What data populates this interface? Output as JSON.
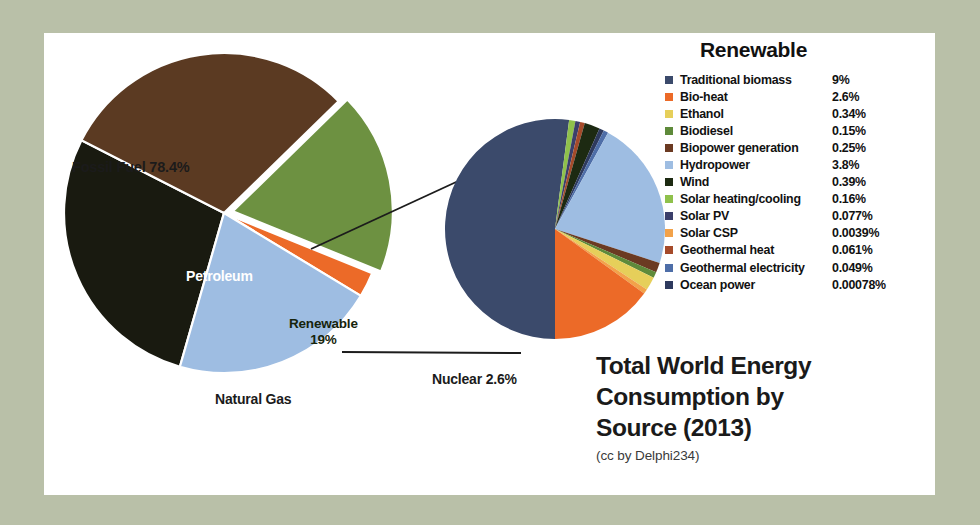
{
  "frame": {
    "background_color": "#b9c0a8",
    "panel_color": "#ffffff"
  },
  "title": {
    "line1": "Total World Energy",
    "line2": "Consumption by",
    "line3": "Source (2013)",
    "credit": "(cc by Delphi234)"
  },
  "legend": {
    "heading": "Renewable",
    "items": [
      {
        "label": "Traditional biomass",
        "value": "9%",
        "color": "#3b4a6b"
      },
      {
        "label": "Bio-heat",
        "value": "2.6%",
        "color": "#ec6a28"
      },
      {
        "label": "Ethanol",
        "value": "0.34%",
        "color": "#e6cf5a"
      },
      {
        "label": "Biodiesel",
        "value": "0.15%",
        "color": "#5e8a3a"
      },
      {
        "label": "Biopower generation",
        "value": "0.25%",
        "color": "#6b3a22"
      },
      {
        "label": "Hydropower",
        "value": "3.8%",
        "color": "#9ebde2"
      },
      {
        "label": "Wind",
        "value": "0.39%",
        "color": "#1d2a12"
      },
      {
        "label": "Solar heating/cooling",
        "value": "0.16%",
        "color": "#8fc14b"
      },
      {
        "label": "Solar PV",
        "value": "0.077%",
        "color": "#3b3f6b"
      },
      {
        "label": "Solar CSP",
        "value": "0.0039%",
        "color": "#f2a24a"
      },
      {
        "label": "Geothermal heat",
        "value": "0.061%",
        "color": "#a54a2a"
      },
      {
        "label": "Geothermal electricity",
        "value": "0.049%",
        "color": "#4e6ea8"
      },
      {
        "label": "Ocean power",
        "value": "0.00078%",
        "color": "#2e3a5e"
      }
    ]
  },
  "main_pie_labels": {
    "fossil_fuel": "Fossil Fuel  78.4%",
    "petroleum": "Petroleum",
    "coal": "Coal",
    "natural_gas": "Natural Gas",
    "renewable_name": "Renewable",
    "renewable_value": "19%",
    "nuclear": "Nuclear 2.6%"
  },
  "chart_data": [
    {
      "type": "pie",
      "id": "main-pie",
      "title": "Total World Energy Consumption by Source (2013)",
      "legend_position": "inline-labels",
      "grid": false,
      "group_annotations": [
        {
          "label": "Fossil Fuel",
          "value": 78.4,
          "unit": "%",
          "members": [
            "Petroleum",
            "Coal",
            "Natural Gas"
          ]
        }
      ],
      "slices": [
        {
          "label": "Petroleum",
          "value": 31.1,
          "unit": "%",
          "color": "#5b3a22",
          "exploded": false
        },
        {
          "label": "Coal",
          "value": 28.9,
          "unit": "%",
          "color": "#191a10",
          "exploded": false
        },
        {
          "label": "Natural Gas",
          "value": 21.4,
          "unit": "%",
          "color": "#9ebde2",
          "exploded": false
        },
        {
          "label": "Nuclear",
          "value": 2.6,
          "unit": "%",
          "color": "#ec6a28",
          "exploded": false
        },
        {
          "label": "Renewable",
          "value": 19.0,
          "unit": "%",
          "color": "#6d9141",
          "exploded": true
        }
      ]
    },
    {
      "type": "pie",
      "id": "renewable-inset-pie",
      "title": "Renewable",
      "legend_position": "right",
      "grid": false,
      "note": "Breakdown of the exploded Renewable slice; values are percent of total world energy.",
      "slices": [
        {
          "label": "Traditional biomass",
          "value": 9.0,
          "unit": "%",
          "color": "#3b4a6b"
        },
        {
          "label": "Bio-heat",
          "value": 2.6,
          "unit": "%",
          "color": "#ec6a28"
        },
        {
          "label": "Ethanol",
          "value": 0.34,
          "unit": "%",
          "color": "#e6cf5a"
        },
        {
          "label": "Biodiesel",
          "value": 0.15,
          "unit": "%",
          "color": "#5e8a3a"
        },
        {
          "label": "Biopower generation",
          "value": 0.25,
          "unit": "%",
          "color": "#6b3a22"
        },
        {
          "label": "Hydropower",
          "value": 3.8,
          "unit": "%",
          "color": "#9ebde2"
        },
        {
          "label": "Wind",
          "value": 0.39,
          "unit": "%",
          "color": "#1d2a12"
        },
        {
          "label": "Solar heating/cooling",
          "value": 0.16,
          "unit": "%",
          "color": "#8fc14b"
        },
        {
          "label": "Solar PV",
          "value": 0.077,
          "unit": "%",
          "color": "#3b3f6b"
        },
        {
          "label": "Solar CSP",
          "value": 0.0039,
          "unit": "%",
          "color": "#f2a24a"
        },
        {
          "label": "Geothermal heat",
          "value": 0.061,
          "unit": "%",
          "color": "#a54a2a"
        },
        {
          "label": "Geothermal electricity",
          "value": 0.049,
          "unit": "%",
          "color": "#4e6ea8"
        },
        {
          "label": "Ocean power",
          "value": 0.00078,
          "unit": "%",
          "color": "#2e3a5e"
        }
      ]
    }
  ]
}
